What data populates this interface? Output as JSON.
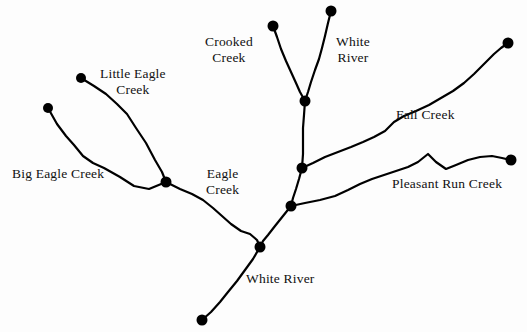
{
  "figure": {
    "width": 527,
    "height": 332,
    "background_color": "#fdfdfd",
    "line_color": "#000000",
    "node_color": "#000000",
    "text_color": "#111111",
    "partial_top_text": "                                                                "
  },
  "labels": [
    {
      "id": "little-eagle-creek",
      "text": "Little Eagle",
      "text2": "Creek",
      "x": 100,
      "y": 66,
      "align": "left"
    },
    {
      "id": "big-eagle-creek",
      "text": "Big Eagle Creek",
      "text2": "",
      "x": 12,
      "y": 166,
      "align": "left"
    },
    {
      "id": "eagle-creek",
      "text": "Eagle",
      "text2": "Creek",
      "x": 206,
      "y": 166,
      "align": "left"
    },
    {
      "id": "crooked-creek",
      "text": "Crooked",
      "text2": "Creek",
      "x": 205,
      "y": 34,
      "align": "left"
    },
    {
      "id": "white-river-top",
      "text": "White",
      "text2": "River",
      "x": 336,
      "y": 34,
      "align": "left"
    },
    {
      "id": "fall-creek",
      "text": "Fall Creek",
      "text2": "",
      "x": 396,
      "y": 107,
      "align": "left"
    },
    {
      "id": "pleasant-run-creek",
      "text": "Pleasant Run Creek",
      "text2": "",
      "x": 392,
      "y": 176,
      "align": "left"
    },
    {
      "id": "white-river-bottom",
      "text": "White River",
      "text2": "",
      "x": 246,
      "y": 271,
      "align": "left"
    }
  ],
  "nodes": [
    {
      "id": "node-big-eagle-source",
      "name": "big-eagle-creek-source",
      "x": 48,
      "y": 108,
      "r": 5
    },
    {
      "id": "node-little-eagle-source",
      "name": "little-eagle-creek-source",
      "x": 81,
      "y": 78,
      "r": 5
    },
    {
      "id": "node-eagle-confluence",
      "name": "eagle-creek-confluence",
      "x": 166,
      "y": 182,
      "r": 5.5
    },
    {
      "id": "node-crooked-source",
      "name": "crooked-creek-source",
      "x": 273,
      "y": 26,
      "r": 5.5
    },
    {
      "id": "node-white-river-source",
      "name": "white-river-source",
      "x": 331,
      "y": 11,
      "r": 5.5
    },
    {
      "id": "node-crooked-white-confluence",
      "name": "crooked-white-confluence",
      "x": 305,
      "y": 101,
      "r": 5.5
    },
    {
      "id": "node-fall-creek-confluence",
      "name": "fall-creek-confluence",
      "x": 302,
      "y": 168,
      "r": 5.5
    },
    {
      "id": "node-pleasant-run-confluence",
      "name": "pleasant-run-confluence",
      "x": 291,
      "y": 206,
      "r": 5.5
    },
    {
      "id": "node-eagle-white-confluence",
      "name": "eagle-white-confluence",
      "x": 260,
      "y": 247,
      "r": 5.5
    },
    {
      "id": "node-white-river-mouth",
      "name": "white-river-mouth",
      "x": 202,
      "y": 320,
      "r": 5.5
    },
    {
      "id": "node-fall-creek-source",
      "name": "fall-creek-source",
      "x": 508,
      "y": 43,
      "r": 5.5
    },
    {
      "id": "node-pleasant-run-source",
      "name": "pleasant-run-creek-source",
      "x": 511,
      "y": 160,
      "r": 5.5
    }
  ],
  "reaches": [
    {
      "id": "reach-big-eagle-creek",
      "name": "big-eagle-creek",
      "points": "48,108 57,124 66,136 74,145 83,156 93,163 104,168 120,177 134,186 149,189 166,182"
    },
    {
      "id": "reach-little-eagle-creek",
      "name": "little-eagle-creek",
      "points": "81,78 94,86 106,94 117,104 127,114 136,128 146,143 155,160 162,172 166,182"
    },
    {
      "id": "reach-eagle-creek",
      "name": "eagle-creek",
      "points": "166,182 180,189 192,194 203,200 213,208 222,216 231,224 241,231 250,234 257,240 260,247"
    },
    {
      "id": "reach-crooked-creek",
      "name": "crooked-creek",
      "points": "273,26 277,37 281,49 286,61 291,72 296,83 300,92 305,101"
    },
    {
      "id": "reach-white-river-upper",
      "name": "white-river-upper",
      "points": "331,11 328,23 325,36 322,48 319,59 315,70 311,82 308,92 305,101"
    },
    {
      "id": "reach-white-river-mid",
      "name": "white-river-mid",
      "points": "305,101 304,115 303,128 303,141 303,154 302,168"
    },
    {
      "id": "reach-white-river-mid2",
      "name": "white-river-mid-lower",
      "points": "302,168 299,179 296,189 293,198 291,206"
    },
    {
      "id": "reach-white-river-lower",
      "name": "white-river-lower",
      "points": "291,206 283,216 275,226 268,235 263,241 260,247"
    },
    {
      "id": "reach-white-river-mouth",
      "name": "white-river-mouth-reach",
      "points": "260,247 253,259 245,270 237,281 228,292 220,302 211,312 202,320"
    },
    {
      "id": "reach-fall-creek",
      "name": "fall-creek",
      "points": "302,168 313,163 325,157 338,152 351,147 363,142 374,137 385,131 394,122 404,116 416,111 429,105 441,98 453,91 464,83 474,74 484,64 494,54 501,48 508,43"
    },
    {
      "id": "reach-pleasant-run-creek",
      "name": "pleasant-run-creek",
      "points": "291,206 305,203 320,200 335,196 348,190 360,184 372,179 384,175 396,171 408,167 418,162 428,154 436,162 446,169 456,165 468,160 480,157 492,156 502,158 511,160"
    }
  ]
}
